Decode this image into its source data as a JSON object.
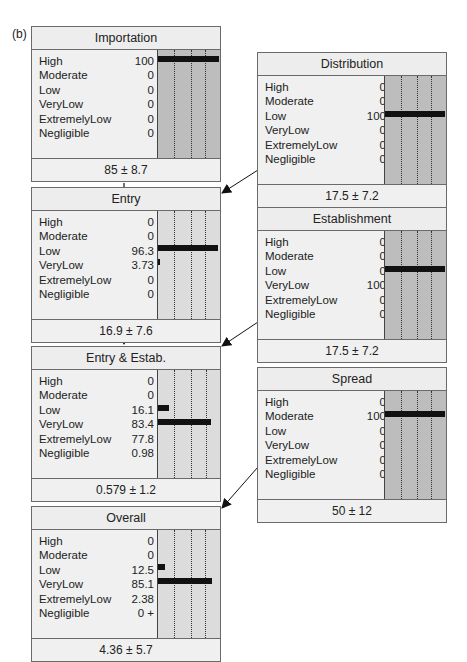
{
  "panel_label": "(b)",
  "states": [
    "High",
    "Moderate",
    "Low",
    "VeryLow",
    "ExtremelyLow",
    "Negligible"
  ],
  "nodes": {
    "importation": {
      "title": "Importation",
      "values": [
        "100",
        "0",
        "0",
        "0",
        "0",
        "0"
      ],
      "bars": [
        100,
        0,
        0,
        0,
        0,
        0
      ],
      "summary": "85 ± 8.7"
    },
    "distribution": {
      "title": "Distribution",
      "values": [
        "0",
        "0",
        "100",
        "0",
        "0",
        "0"
      ],
      "bars": [
        0,
        0,
        100,
        0,
        0,
        0
      ],
      "summary": "17.5 ± 7.2"
    },
    "entry": {
      "title": "Entry",
      "values": [
        "0",
        "0",
        "96.3",
        "3.73",
        "0",
        "0"
      ],
      "bars": [
        0,
        0,
        96.3,
        3.73,
        0,
        0
      ],
      "summary": "16.9 ± 7.6"
    },
    "establishment": {
      "title": "Establishment",
      "values": [
        "0",
        "0",
        "0",
        "100",
        "0",
        "0"
      ],
      "bars": [
        0,
        0,
        0,
        100,
        0,
        0
      ],
      "summary": "17.5 ± 7.2"
    },
    "entry_estab": {
      "title": "Entry & Estab.",
      "values": [
        "0",
        "0",
        "16.1",
        "83.4",
        "77.8",
        "0.98"
      ],
      "bars": [
        0,
        0,
        16.1,
        83.4,
        0,
        0
      ],
      "summary": "0.579 ± 1.2"
    },
    "spread": {
      "title": "Spread",
      "values": [
        "0",
        "100",
        "0",
        "0",
        "0",
        "0"
      ],
      "bars": [
        0,
        100,
        0,
        0,
        0,
        0
      ],
      "summary": "50 ± 12"
    },
    "overall": {
      "title": "Overall",
      "values": [
        "0",
        "0",
        "12.5",
        "85.1",
        "2.38",
        "0 +"
      ],
      "bars": [
        0,
        0,
        12.5,
        85.1,
        0,
        0
      ],
      "summary": "4.36 ± 5.7"
    }
  }
}
